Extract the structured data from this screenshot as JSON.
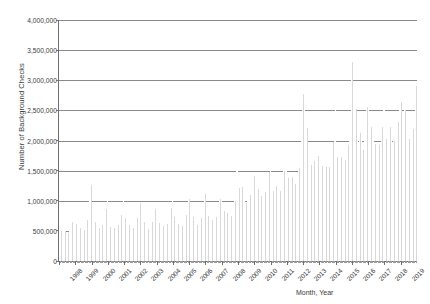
{
  "chart_data": {
    "type": "bar",
    "title": "",
    "xlabel": "Month, Year",
    "ylabel": "Number of Background Checks",
    "ylim": [
      0,
      4000000
    ],
    "ytick_labels": [
      "4,000,000",
      "3,500,000",
      "3,000,000",
      "2,500,000",
      "2,000,000",
      "1,500,000",
      "1,000,000",
      "500,000",
      "0"
    ],
    "ytick_values": [
      4000000,
      3500000,
      3000000,
      2500000,
      2000000,
      1500000,
      1000000,
      500000,
      0
    ],
    "grid": true,
    "legend": "none",
    "x_major_labels": [
      "1998",
      "1999",
      "2000",
      "2001",
      "2002",
      "2003",
      "2004",
      "2005",
      "2006",
      "2007",
      "2008",
      "2009",
      "2010",
      "2011",
      "2012",
      "2013",
      "2014",
      "2015",
      "2016",
      "2017",
      "2018",
      "2019"
    ],
    "x_note": "monthly data points, Jan 1998 through Dec 2019",
    "values": [
      588000,
      495000,
      555000,
      510000,
      490000,
      470000,
      470000,
      520000,
      560000,
      640000,
      820000,
      960000,
      610000,
      520000,
      580000,
      545000,
      520000,
      500000,
      520000,
      600000,
      680000,
      830000,
      1040000,
      1260000,
      700000,
      600000,
      650000,
      600000,
      575000,
      545000,
      545000,
      600000,
      650000,
      720000,
      860000,
      1010000,
      660000,
      570000,
      620000,
      565000,
      540000,
      520000,
      530000,
      590000,
      640000,
      760000,
      920000,
      1040000,
      720000,
      610000,
      650000,
      590000,
      560000,
      530000,
      545000,
      600000,
      640000,
      720000,
      850000,
      960000,
      690000,
      590000,
      640000,
      580000,
      555000,
      530000,
      545000,
      600000,
      640000,
      720000,
      860000,
      980000,
      720000,
      630000,
      670000,
      600000,
      575000,
      545000,
      560000,
      620000,
      660000,
      760000,
      880000,
      1010000,
      730000,
      640000,
      690000,
      620000,
      590000,
      565000,
      580000,
      640000,
      680000,
      770000,
      900000,
      1030000,
      780000,
      680000,
      730000,
      650000,
      625000,
      600000,
      615000,
      680000,
      720000,
      820000,
      960000,
      1120000,
      840000,
      740000,
      790000,
      700000,
      680000,
      650000,
      665000,
      730000,
      780000,
      880000,
      1030000,
      1230000,
      940000,
      830000,
      890000,
      790000,
      760000,
      730000,
      750000,
      830000,
      880000,
      990000,
      1530000,
      1520000,
      1210000,
      1260000,
      1230000,
      1080000,
      1020000,
      970000,
      990000,
      1060000,
      1100000,
      1230000,
      1220000,
      1410000,
      1080000,
      1020000,
      1190000,
      1130000,
      1080000,
      1030000,
      1060000,
      1150000,
      1190000,
      1370000,
      1480000,
      1640000,
      1210000,
      1170000,
      1310000,
      1250000,
      1190000,
      1140000,
      1170000,
      1260000,
      1320000,
      1500000,
      1620000,
      1860000,
      1380000,
      1320000,
      1470000,
      1400000,
      1330000,
      1280000,
      1320000,
      1440000,
      1540000,
      1780000,
      2000000,
      2780000,
      2500000,
      2310000,
      2210000,
      1970000,
      1730000,
      1590000,
      1560000,
      1660000,
      1610000,
      1690000,
      1750000,
      1810000,
      1660000,
      1580000,
      1680000,
      1600000,
      1560000,
      1510000,
      1560000,
      1700000,
      1770000,
      1980000,
      2280000,
      2720000,
      1720000,
      1620000,
      1790000,
      1720000,
      1680000,
      1630000,
      1680000,
      1830000,
      1920000,
      2180000,
      2240000,
      3310000,
      2540000,
      2610000,
      2520000,
      2130000,
      1870000,
      2130000,
      2200000,
      1850000,
      1990000,
      2330000,
      2560000,
      2770000,
      2040000,
      2230000,
      2420000,
      2130000,
      1940000,
      1880000,
      1850000,
      1930000,
      1960000,
      2220000,
      2550000,
      2580000,
      2030000,
      2130000,
      2420000,
      2220000,
      2030000,
      1980000,
      2000000,
      2100000,
      2090000,
      2300000,
      2600000,
      2640000,
      2200000,
      2200000,
      2500000,
      2250000,
      2100000,
      2030000,
      2030000,
      2130000,
      2190000,
      2400000,
      2900000,
      3740000
    ]
  }
}
